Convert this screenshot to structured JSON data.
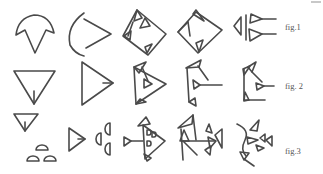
{
  "figure": {
    "title": "",
    "rows": [
      {
        "label": "fig.1",
        "glyph_count": 5,
        "description": "pictograph evolving to cuneiform (arrow/curved sign)"
      },
      {
        "label": "fig. 2",
        "glyph_count": 5,
        "description": "triangle pictograph evolving to cuneiform"
      },
      {
        "label": "fig.3",
        "glyph_count": 5,
        "description": "triangle with semicircles evolving to complex cuneiform"
      }
    ],
    "stroke_color": "#4a4a4a",
    "background_color": "#ffffff"
  }
}
